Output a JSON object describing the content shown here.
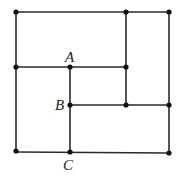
{
  "diagram": {
    "type": "geometry-grid",
    "colors": {
      "line": "#2a2a2a",
      "point": "#111111",
      "label": "#222222",
      "background": "#ffffff"
    },
    "points": [
      {
        "id": "p1",
        "x": 16,
        "y": 12
      },
      {
        "id": "p2",
        "x": 126,
        "y": 12
      },
      {
        "id": "p3",
        "x": 169,
        "y": 12
      },
      {
        "id": "p4",
        "x": 16,
        "y": 67
      },
      {
        "id": "A",
        "x": 70,
        "y": 67,
        "label": "A"
      },
      {
        "id": "p6",
        "x": 126,
        "y": 67
      },
      {
        "id": "B",
        "x": 70,
        "y": 105,
        "label": "B"
      },
      {
        "id": "p8",
        "x": 126,
        "y": 105
      },
      {
        "id": "p9",
        "x": 169,
        "y": 105
      },
      {
        "id": "p10",
        "x": 16,
        "y": 151
      },
      {
        "id": "C",
        "x": 70,
        "y": 152,
        "label": "C"
      },
      {
        "id": "p12",
        "x": 169,
        "y": 153
      }
    ],
    "segments": [
      {
        "from": [
          16,
          12
        ],
        "to": [
          169,
          12
        ]
      },
      {
        "from": [
          169,
          12
        ],
        "to": [
          169,
          153
        ]
      },
      {
        "from": [
          16,
          152
        ],
        "to": [
          169,
          153
        ]
      },
      {
        "from": [
          16,
          12
        ],
        "to": [
          16,
          152
        ]
      },
      {
        "from": [
          126,
          12
        ],
        "to": [
          126,
          105
        ]
      },
      {
        "from": [
          16,
          67
        ],
        "to": [
          126,
          67
        ]
      },
      {
        "from": [
          70,
          67
        ],
        "to": [
          70,
          152
        ]
      },
      {
        "from": [
          70,
          105
        ],
        "to": [
          169,
          105
        ]
      }
    ],
    "labels": {
      "A": {
        "text": "A",
        "x": 65,
        "y": 62
      },
      "B": {
        "text": "B",
        "x": 55,
        "y": 110
      },
      "C": {
        "text": "C",
        "x": 64,
        "y": 170
      }
    }
  }
}
